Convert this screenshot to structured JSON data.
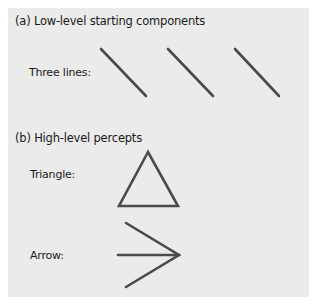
{
  "section_a": {
    "heading": "(a) Low-level starting components",
    "label": "Three lines:",
    "shape": "three-diagonal-lines"
  },
  "section_b": {
    "heading": "(b) High-level percepts",
    "items": [
      {
        "label": "Triangle:",
        "shape": "triangle"
      },
      {
        "label": "Arrow:",
        "shape": "arrow"
      }
    ]
  },
  "colors": {
    "panel_background": "#ebebeb",
    "stroke": "#4a4a4a",
    "text": "#1a1a1a"
  }
}
